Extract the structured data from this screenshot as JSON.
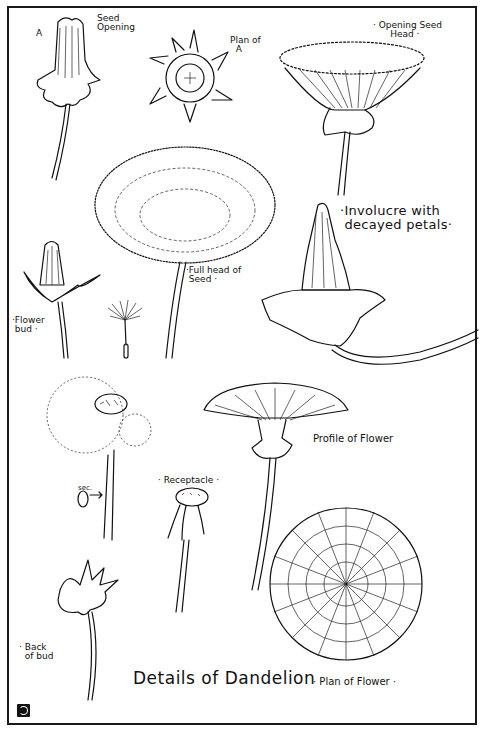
{
  "plate": {
    "title": "Details of Dandelion",
    "subtitle": "Plan of Flower",
    "monogram": "monogram-icon"
  },
  "labels": {
    "a_marker": "A",
    "seed_opening": "Seed\nOpening",
    "plan_of_a": "Plan of\n  A",
    "opening_seed_head": "· Opening Seed\n      Head ·",
    "involucre": "·Involucre with\n decayed petals·",
    "full_head": "·Full head of\n Seed ·",
    "flower_bud": "·Flower\n bud ·",
    "sec": "sec.",
    "receptacle": "· Receptacle ·",
    "profile": "Profile of Flower",
    "back_of_bud": "· Back\n  of bud",
    "title_line": "Details of Dandelion",
    "plan_of_flower": "· Plan of Flower ·"
  },
  "drawings": [
    {
      "id": "seed-opening",
      "label": "Seed Opening"
    },
    {
      "id": "plan-of-a",
      "label": "Plan of A"
    },
    {
      "id": "opening-seed-head",
      "label": "Opening Seed Head"
    },
    {
      "id": "full-head-of-seed",
      "label": "Full head of Seed"
    },
    {
      "id": "involucre-decayed",
      "label": "Involucre with decayed petals"
    },
    {
      "id": "flower-bud",
      "label": "Flower bud"
    },
    {
      "id": "single-seed",
      "label": ""
    },
    {
      "id": "partial-seed-head",
      "label": ""
    },
    {
      "id": "stem-section",
      "label": "sec."
    },
    {
      "id": "receptacle",
      "label": "Receptacle"
    },
    {
      "id": "profile-of-flower",
      "label": "Profile of Flower"
    },
    {
      "id": "back-of-bud",
      "label": "Back of bud"
    },
    {
      "id": "plan-of-flower",
      "label": "Plan of Flower"
    }
  ],
  "colors": {
    "ink": "#111111",
    "paper": "#ffffff"
  }
}
